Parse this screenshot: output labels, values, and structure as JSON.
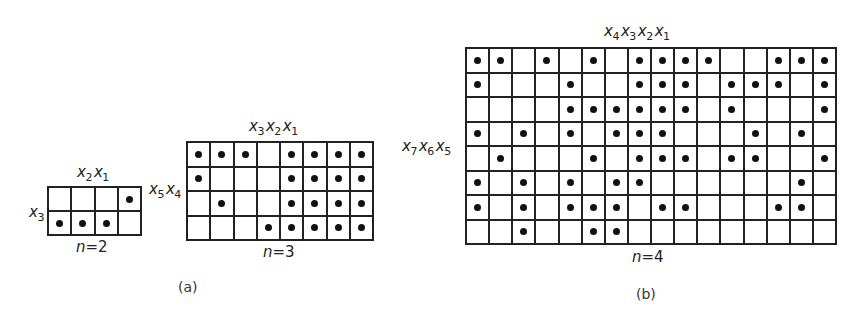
{
  "figure": {
    "panel_a_caption": "(a)",
    "panel_b_caption": "(b)",
    "grids": [
      {
        "id": "n2",
        "n_label": "n=2",
        "n_var": "n",
        "n_value": "=2",
        "cols": 4,
        "rows": 2,
        "col_vars": [
          {
            "v": "x",
            "s": "2"
          },
          {
            "v": "x",
            "s": "1"
          }
        ],
        "row_vars": [
          {
            "v": "x",
            "s": "3"
          }
        ],
        "dots": [
          [
            4
          ],
          [
            1,
            2,
            3
          ]
        ]
      },
      {
        "id": "n3",
        "n_label": "n=3",
        "n_var": "n",
        "n_value": "=3",
        "cols": 8,
        "rows": 4,
        "col_vars": [
          {
            "v": "x",
            "s": "3"
          },
          {
            "v": "x",
            "s": "2"
          },
          {
            "v": "x",
            "s": "1"
          }
        ],
        "row_vars": [
          {
            "v": "x",
            "s": "5"
          },
          {
            "v": "x",
            "s": "4"
          }
        ],
        "dots": [
          [
            1,
            2,
            3,
            5,
            6,
            7,
            8
          ],
          [
            1,
            5,
            6,
            7,
            8
          ],
          [
            2,
            5,
            6,
            7,
            8
          ],
          [
            4,
            5,
            6,
            7,
            8
          ]
        ]
      },
      {
        "id": "n4",
        "n_label": "n=4",
        "n_var": "n",
        "n_value": "=4",
        "cols": 16,
        "rows": 8,
        "col_vars": [
          {
            "v": "x",
            "s": "4"
          },
          {
            "v": "x",
            "s": "3"
          },
          {
            "v": "x",
            "s": "2"
          },
          {
            "v": "x",
            "s": "1"
          }
        ],
        "row_vars": [
          {
            "v": "x",
            "s": "7"
          },
          {
            "v": "x",
            "s": "6"
          },
          {
            "v": "x",
            "s": "5"
          }
        ],
        "dots": [
          [
            1,
            2,
            4,
            6,
            8,
            9,
            10,
            11,
            14,
            15,
            16
          ],
          [
            1,
            5,
            8,
            9,
            10,
            12,
            13,
            14,
            16
          ],
          [
            5,
            6,
            7,
            8,
            9,
            10,
            12,
            16
          ],
          [
            1,
            3,
            5,
            7,
            8,
            9,
            13,
            15
          ],
          [
            2,
            6,
            8,
            9,
            10,
            12,
            13,
            16
          ],
          [
            1,
            3,
            5,
            7,
            8,
            15
          ],
          [
            1,
            3,
            5,
            6,
            7,
            9,
            10,
            14,
            15
          ],
          [
            3,
            6,
            7
          ]
        ]
      }
    ]
  }
}
